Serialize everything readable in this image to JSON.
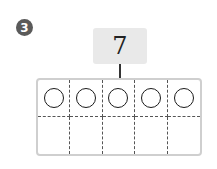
{
  "problem": {
    "number": "3",
    "target_value": "7",
    "ten_frame": {
      "columns": 5,
      "rows": 2,
      "top_row": [
        "circle",
        "circle",
        "circle",
        "circle",
        "circle"
      ],
      "bottom_row": [
        "",
        "",
        "",
        "",
        ""
      ]
    }
  },
  "colors": {
    "badge": "#5a5a5a",
    "number_box": "#e9e9e9",
    "frame_border": "#cfcfcf"
  }
}
